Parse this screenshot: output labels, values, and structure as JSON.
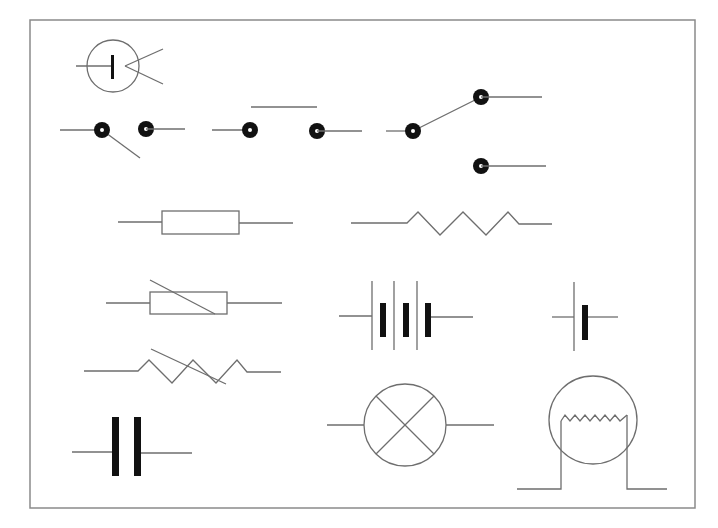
{
  "diagram": {
    "stroke_color": "#6e6e6e",
    "fill_color": "#111111",
    "frame_color": "#8a8a8a",
    "symbols": [
      {
        "id": "light-dependent-cell",
        "label": "Photocell / LED-in-circle symbol"
      },
      {
        "id": "push-switch-open",
        "label": "Open switch (single pole)"
      },
      {
        "id": "push-to-make-switch",
        "label": "Push-to-make switch"
      },
      {
        "id": "two-way-switch",
        "label": "Two-way switch"
      },
      {
        "id": "fixed-resistor-box",
        "label": "Fixed resistor (box)"
      },
      {
        "id": "fixed-resistor-zigzag",
        "label": "Fixed resistor (zigzag)"
      },
      {
        "id": "variable-resistor-box",
        "label": "Variable resistor (box)"
      },
      {
        "id": "battery",
        "label": "Battery (multiple cells)"
      },
      {
        "id": "cell",
        "label": "Single cell"
      },
      {
        "id": "variable-resistor-zigzag",
        "label": "Variable resistor (zigzag)"
      },
      {
        "id": "capacitor",
        "label": "Capacitor"
      },
      {
        "id": "lamp",
        "label": "Lamp"
      },
      {
        "id": "filament-lamp",
        "label": "Filament lamp"
      }
    ]
  }
}
